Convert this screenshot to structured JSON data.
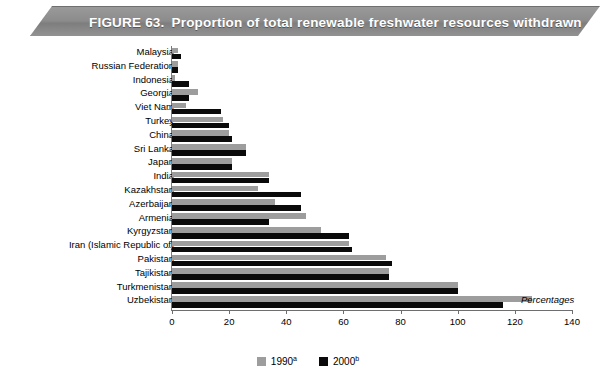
{
  "figure": {
    "number_label": "FIGURE 63.",
    "title": "Proportion of total renewable freshwater resources withdrawn"
  },
  "annotation": {
    "units_note": "Percentages"
  },
  "legend": {
    "position": "bottom-center",
    "items": [
      {
        "name": "1990",
        "note": "a",
        "color": "#9d9d9d"
      },
      {
        "name": "2000",
        "note": "b",
        "color": "#0a0a0a"
      }
    ]
  },
  "chart_data": {
    "type": "bar",
    "orientation": "horizontal",
    "title": "Proportion of total renewable freshwater resources withdrawn",
    "xlabel": "Percentages",
    "ylabel": "",
    "xlim": [
      0,
      140
    ],
    "xticks": [
      0,
      20,
      40,
      60,
      80,
      100,
      120,
      140
    ],
    "grid": false,
    "categories": [
      "Malaysia",
      "Russian Federation",
      "Indonesia",
      "Georgia",
      "Viet Nam",
      "Turkey",
      "China",
      "Sri Lanka",
      "Japan",
      "India",
      "Kazakhstan",
      "Azerbaijan",
      "Armenia",
      "Kyrgyzstan",
      "Iran (Islamic Republic of)",
      "Pakistan",
      "Tajikistan",
      "Turkmenistan",
      "Uzbekistan"
    ],
    "series": [
      {
        "name": "1990a",
        "color": "#9d9d9d",
        "values": [
          2,
          2,
          1,
          9,
          5,
          18,
          20,
          26,
          21,
          34,
          30,
          36,
          47,
          52,
          62,
          75,
          76,
          100,
          126
        ]
      },
      {
        "name": "2000b",
        "color": "#0a0a0a",
        "values": [
          3,
          2,
          6,
          6,
          17,
          20,
          21,
          26,
          21,
          34,
          45,
          45,
          34,
          62,
          63,
          77,
          76,
          100,
          116
        ]
      }
    ]
  }
}
